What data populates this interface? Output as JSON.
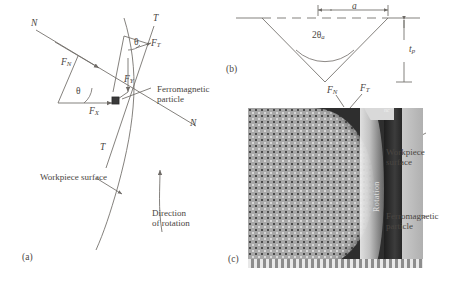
{
  "figure": {
    "panels": [
      {
        "id": "panel-a",
        "label": "(a)"
      },
      {
        "id": "panel-b",
        "label": "(b)"
      },
      {
        "id": "panel-c",
        "label": "(c)"
      }
    ]
  },
  "panel_a": {
    "label": "(a)",
    "axis_labels": {
      "normal_upper_left": "N",
      "normal_lower_right": "N",
      "tangential_upper": "T",
      "tangential_lower": "T"
    },
    "forces": {
      "fn": {
        "base": "F",
        "sub": "N"
      },
      "ft": {
        "base": "F",
        "sub": "T"
      },
      "fx": {
        "base": "F",
        "sub": "X"
      },
      "fy": {
        "base": "F",
        "sub": "Y"
      }
    },
    "angles": {
      "theta_upper": "θ",
      "theta_lower": "θ"
    },
    "annotations": {
      "particle_line1": "Ferromagnetic",
      "particle_line2": "particle",
      "workpiece_surface": "Workpiece surface",
      "rotation_line1": "Direction",
      "rotation_line2": "of rotation"
    }
  },
  "panel_b": {
    "label": "(b)",
    "width_symbol": "a",
    "angle_symbol": {
      "prefix": "2",
      "theta": "θ",
      "sub": "a"
    },
    "depth_symbol": {
      "base": "t",
      "sub": "p"
    }
  },
  "panel_c": {
    "label": "(c)",
    "forces": {
      "fn": {
        "base": "F",
        "sub": "N"
      },
      "ft": {
        "base": "F",
        "sub": "T"
      }
    },
    "overlay_text": {
      "corner_tag": "nc",
      "rotation": "Rotation"
    },
    "annotations": {
      "workpiece_line1": "Workpiece",
      "workpiece_line2": "surface",
      "particle_line1": "Ferromagnetic",
      "particle_line2": "particle"
    }
  },
  "colors": {
    "background": "#ffffff",
    "ink": "#4a4642",
    "line": "#6e6a66",
    "image_dark": "#2e2e2e",
    "image_mid": "#9a9a9a",
    "image_light": "#d9d9d9"
  }
}
